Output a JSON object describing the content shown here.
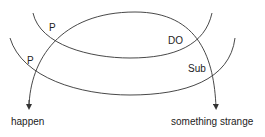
{
  "diagram": {
    "labels": {
      "p_upper": "P",
      "do": "DO",
      "p_lower": "P",
      "sub": "Sub",
      "happen": "happen",
      "something_strange": "something strange"
    },
    "colors": {
      "stroke": "#333333",
      "text": "#222222",
      "background": "#ffffff"
    }
  }
}
